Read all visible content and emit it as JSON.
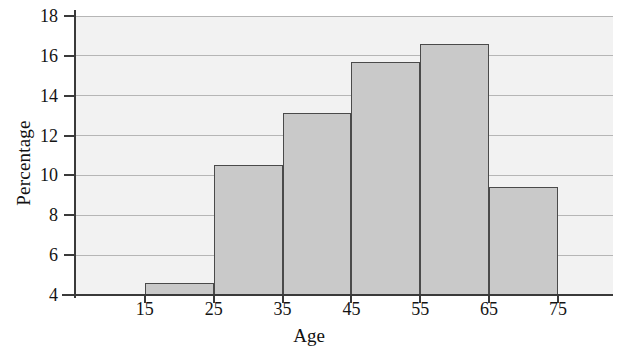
{
  "chart_data": {
    "type": "bar",
    "title": "",
    "subtitle": "",
    "xlabel": "Age",
    "ylabel": "Percentage",
    "categories": [
      "15-25",
      "25-35",
      "35-45",
      "45-55",
      "55-65",
      "65-75"
    ],
    "bin_edges": [
      15,
      25,
      35,
      45,
      55,
      65,
      75
    ],
    "values": [
      4.6,
      10.5,
      13.15,
      15.7,
      16.6,
      9.4
    ],
    "xtick_labels": [
      "15",
      "25",
      "35",
      "45",
      "55",
      "65",
      "75"
    ],
    "xtick_values": [
      15,
      25,
      35,
      45,
      55,
      65,
      75
    ],
    "ytick_labels": [
      "4",
      "6",
      "8",
      "10",
      "12",
      "14",
      "16",
      "18"
    ],
    "ytick_values": [
      4,
      6,
      8,
      10,
      12,
      14,
      16,
      18
    ],
    "ylim": [
      4,
      18
    ],
    "xlim": [
      5,
      83
    ],
    "grid": "horizontal",
    "legend": "none",
    "bar_fill_color": "#c9c9c9",
    "bar_edge_color": "#4a4a4a",
    "plot_background_color": "#f2f2f2",
    "gridline_color": "#b6b6b6",
    "axis_color": "#3a3a3a"
  }
}
